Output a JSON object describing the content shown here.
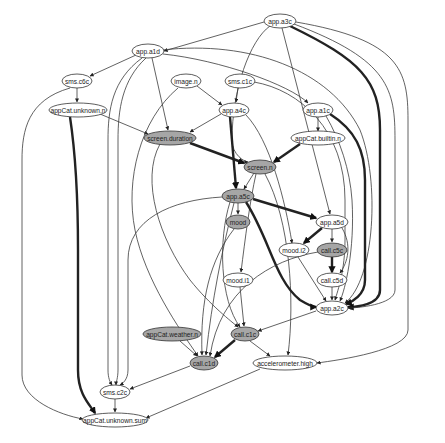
{
  "header": {
    "clipped_text": "·················"
  },
  "graph": {
    "title": "",
    "colors": {
      "filled_node": "#a6a6a6",
      "plain_node": "#ffffff",
      "edge": "#3a3a3a"
    },
    "nodes": [
      {
        "id": "app.a3c",
        "label": "app.a3c",
        "x": 280,
        "y": 21,
        "rx": 16,
        "filled": false
      },
      {
        "id": "app.a1d",
        "label": "app.a1d",
        "x": 148,
        "y": 51,
        "rx": 16,
        "filled": false
      },
      {
        "id": "sms.c6c",
        "label": "sms.c6c",
        "x": 77,
        "y": 81,
        "rx": 15,
        "filled": false
      },
      {
        "id": "image.n",
        "label": "image.n",
        "x": 186,
        "y": 81,
        "rx": 15,
        "filled": false
      },
      {
        "id": "sms.c1c",
        "label": "sms.c1c",
        "x": 240,
        "y": 81,
        "rx": 15,
        "filled": false
      },
      {
        "id": "appCat.unknown.n",
        "label": "appCat.unknown.n",
        "x": 78,
        "y": 110,
        "rx": 29,
        "filled": false
      },
      {
        "id": "app.a4c",
        "label": "app.a4c",
        "x": 234,
        "y": 110,
        "rx": 15,
        "filled": false
      },
      {
        "id": "app.a1c",
        "label": "app.a1c",
        "x": 318,
        "y": 110,
        "rx": 15,
        "filled": false
      },
      {
        "id": "appCat.builtin.n",
        "label": "appCat.builtin.n",
        "x": 318,
        "y": 138,
        "rx": 27,
        "filled": false
      },
      {
        "id": "screen.duration",
        "label": "screen.duration",
        "x": 170,
        "y": 138,
        "rx": 26,
        "filled": true
      },
      {
        "id": "screen.n",
        "label": "screen.n",
        "x": 260,
        "y": 167,
        "rx": 16,
        "filled": true
      },
      {
        "id": "app.a5c",
        "label": "app.a5c",
        "x": 238,
        "y": 196,
        "rx": 16,
        "filled": true
      },
      {
        "id": "mood",
        "label": "mood",
        "x": 238,
        "y": 222,
        "rx": 12,
        "filled": true
      },
      {
        "id": "app.a5d",
        "label": "app.a5d",
        "x": 332,
        "y": 222,
        "rx": 16,
        "filled": false
      },
      {
        "id": "mood.i2",
        "label": "mood.i2",
        "x": 294,
        "y": 250,
        "rx": 15,
        "filled": false
      },
      {
        "id": "call.c5c",
        "label": "call.c5c",
        "x": 332,
        "y": 250,
        "rx": 15,
        "filled": true
      },
      {
        "id": "mood.i1",
        "label": "mood.i1",
        "x": 238,
        "y": 280,
        "rx": 15,
        "filled": false
      },
      {
        "id": "call.c5d",
        "label": "call.c5d",
        "x": 332,
        "y": 280,
        "rx": 15,
        "filled": false
      },
      {
        "id": "app.a2c",
        "label": "app.a2c",
        "x": 332,
        "y": 308,
        "rx": 16,
        "filled": false
      },
      {
        "id": "appCat.weather.n",
        "label": "appCat.weather.n",
        "x": 172,
        "y": 334,
        "rx": 29,
        "filled": true
      },
      {
        "id": "call.c1c",
        "label": "call.c1c",
        "x": 245,
        "y": 334,
        "rx": 14,
        "filled": true
      },
      {
        "id": "call.c1d",
        "label": "call.c1d",
        "x": 204,
        "y": 363,
        "rx": 14,
        "filled": true
      },
      {
        "id": "accelerometer.high",
        "label": "accelerometer.high",
        "x": 285,
        "y": 363,
        "rx": 32,
        "filled": false
      },
      {
        "id": "sms.c2c",
        "label": "sms.c2c",
        "x": 115,
        "y": 392,
        "rx": 15,
        "filled": false
      },
      {
        "id": "appCat.unknown.sum",
        "label": "appCat.unknown.sum",
        "x": 115,
        "y": 420,
        "rx": 33,
        "filled": false
      }
    ],
    "edges": [
      {
        "from": "app.a3c",
        "to": "app.a1d",
        "d": "M264,22 L164,51",
        "thick": false
      },
      {
        "from": "app.a3c",
        "to": "screen.n",
        "d": "M270,26 C250,40 232,90 232,140 C232,155 245,162 248,162",
        "thick": false
      },
      {
        "from": "app.a3c",
        "to": "app.a5d",
        "d": "M282,28 L330,214",
        "thick": false
      },
      {
        "from": "app.a3c",
        "to": "app.a2c",
        "d": "M290,26 C360,60 380,80 380,130 L380,290 C380,305 356,307 348,307",
        "thick": true
      },
      {
        "from": "app.a3c",
        "to": "app.a2c",
        "d": "M294,24 C390,60 395,90 395,140 L395,290 C395,305 356,308 348,308",
        "thick": false
      },
      {
        "from": "app.a3c",
        "to": "accelerometer.high",
        "d": "M296,22 C400,40 408,70 408,120 L408,330 C408,350 340,360 317,363",
        "thick": false
      },
      {
        "from": "app.a1d",
        "to": "sms.c6c",
        "d": "M136,55 L90,76",
        "thick": false
      },
      {
        "from": "app.a1d",
        "to": "app.a1c",
        "d": "M163,54 C220,60 290,85 308,103",
        "thick": false
      },
      {
        "from": "app.a1d",
        "to": "screen.duration",
        "d": "M152,58 L168,130",
        "thick": false
      },
      {
        "from": "app.a1d",
        "to": "sms.c2c",
        "d": "M142,58 C112,80 108,110 108,140 L108,370 C108,378 110,382 112,385",
        "thick": false
      },
      {
        "from": "app.a1d",
        "to": "sms.c2c",
        "d": "M146,58 C122,80 118,110 118,140 L118,370 C118,378 116,382 116,385",
        "thick": false
      },
      {
        "from": "app.a1d",
        "to": "app.a2c",
        "d": "M162,50 C250,40 330,70 360,130 C380,180 375,280 345,303",
        "thick": false
      },
      {
        "from": "sms.c6c",
        "to": "appCat.unknown.n",
        "d": "M77,88 L77,102",
        "thick": false
      },
      {
        "from": "sms.c6c",
        "to": "appCat.unknown.sum",
        "d": "M70,88 C28,100 22,130 22,160 L22,375 C22,400 60,415 83,419",
        "thick": false
      },
      {
        "from": "appCat.unknown.n",
        "to": "screen.duration",
        "d": "M100,114 L148,134",
        "thick": false
      },
      {
        "from": "appCat.unknown.n",
        "to": "appCat.unknown.sum",
        "d": "M70,117 C75,150 78,200 78,250 L78,370 C78,395 90,405 95,413",
        "thick": true
      },
      {
        "from": "image.n",
        "to": "app.a4c",
        "d": "M197,86 L222,105",
        "thick": false
      },
      {
        "from": "image.n",
        "to": "call.c1d",
        "d": "M178,88 C140,120 125,180 135,230 C145,280 180,330 198,356",
        "thick": false
      },
      {
        "from": "sms.c1c",
        "to": "app.a4c",
        "d": "M238,88 L236,102",
        "thick": false
      },
      {
        "from": "sms.c1c",
        "to": "app.a2c",
        "d": "M254,82 C300,90 345,130 345,200 L345,240 C345,270 338,290 335,300",
        "thick": false
      },
      {
        "from": "app.a4c",
        "to": "screen.duration",
        "d": "M221,114 L190,132",
        "thick": false
      },
      {
        "from": "app.a4c",
        "to": "app.a5c",
        "d": "M230,117 L236,188",
        "thick": true
      },
      {
        "from": "app.a4c",
        "to": "mood.i2",
        "d": "M246,115 C270,140 285,200 292,243",
        "thick": false
      },
      {
        "from": "app.a1c",
        "to": "appCat.builtin.n",
        "d": "M318,117 L318,131",
        "thick": false
      },
      {
        "from": "app.a1c",
        "to": "app.a2c",
        "d": "M330,114 C355,130 365,150 365,180 L365,280 C365,295 352,302 346,304",
        "thick": true
      },
      {
        "from": "app.a1c",
        "to": "app.a2c",
        "d": "M326,116 C340,140 350,170 352,200 C355,250 345,290 340,301",
        "thick": false
      },
      {
        "from": "appCat.builtin.n",
        "to": "screen.n",
        "d": "M300,144 L274,162",
        "thick": true
      },
      {
        "from": "screen.duration",
        "to": "screen.n",
        "d": "M190,143 L244,163",
        "thick": true
      },
      {
        "from": "screen.duration",
        "to": "call.c1c",
        "d": "M160,144 C140,180 160,240 190,280 C210,305 232,322 238,327",
        "thick": false
      },
      {
        "from": "screen.n",
        "to": "app.a5c",
        "d": "M254,173 L244,189",
        "thick": false
      },
      {
        "from": "screen.n",
        "to": "mood.i1",
        "d": "M256,174 C250,200 245,240 241,272",
        "thick": false
      },
      {
        "from": "screen.n",
        "to": "accelerometer.high",
        "d": "M265,174 C290,220 295,300 288,355",
        "thick": false
      },
      {
        "from": "app.a5c",
        "to": "mood",
        "d": "M238,203 L238,214",
        "thick": false
      },
      {
        "from": "app.a5c",
        "to": "app.a5d",
        "d": "M253,199 L316,218",
        "thick": true
      },
      {
        "from": "app.a5c",
        "to": "app.a2c",
        "d": "M246,202 C270,240 275,280 300,300 C310,306 315,307 316,307",
        "thick": true
      },
      {
        "from": "app.a5c",
        "to": "sms.c2c",
        "d": "M222,197 C170,200 128,220 128,260 L128,370 C128,380 122,384 120,385",
        "thick": false
      },
      {
        "from": "app.a5c",
        "to": "call.c1c",
        "d": "M230,202 C218,240 220,300 240,327",
        "thick": false
      },
      {
        "from": "app.a5c",
        "to": "call.c1d",
        "d": "M234,203 C222,250 212,300 206,355",
        "thick": false
      },
      {
        "from": "mood",
        "to": "call.c1d",
        "d": "M234,229 C210,260 200,300 202,355",
        "thick": false
      },
      {
        "from": "mood.i1",
        "to": "call.c1c",
        "d": "M240,287 L244,326",
        "thick": false
      },
      {
        "from": "app.a5d",
        "to": "mood.i2",
        "d": "M322,228 L304,243",
        "thick": true
      },
      {
        "from": "app.a5d",
        "to": "call.c5c",
        "d": "M332,229 L332,242",
        "thick": false
      },
      {
        "from": "app.a5d",
        "to": "call.c5d",
        "d": "M342,228 C352,245 348,262 340,273",
        "thick": false
      },
      {
        "from": "call.c5c",
        "to": "call.c5d",
        "d": "M332,257 L332,272",
        "thick": true
      },
      {
        "from": "call.c5c",
        "to": "call.c1d",
        "d": "M318,252 C270,260 220,290 210,356",
        "thick": false
      },
      {
        "from": "mood.i2",
        "to": "app.a2c",
        "d": "M298,257 L326,301",
        "thick": false
      },
      {
        "from": "call.c5d",
        "to": "app.a2c",
        "d": "M332,287 L332,300",
        "thick": false
      },
      {
        "from": "app.a2c",
        "to": "call.c1c",
        "d": "M316,311 L258,331",
        "thick": false
      },
      {
        "from": "appCat.weather.n",
        "to": "call.c1d",
        "d": "M180,341 L197,356",
        "thick": false
      },
      {
        "from": "call.c1c",
        "to": "call.c1d",
        "d": "M235,340 L215,357",
        "thick": true
      },
      {
        "from": "call.c1c",
        "to": "accelerometer.high",
        "d": "M250,341 L270,356",
        "thick": false
      },
      {
        "from": "call.c1d",
        "to": "sms.c2c",
        "d": "M190,366 L130,389",
        "thick": false
      },
      {
        "from": "accelerometer.high",
        "to": "appCat.unknown.sum",
        "d": "M260,369 L146,418",
        "thick": false
      },
      {
        "from": "sms.c2c",
        "to": "appCat.unknown.sum",
        "d": "M115,399 L115,412",
        "thick": false
      }
    ]
  }
}
